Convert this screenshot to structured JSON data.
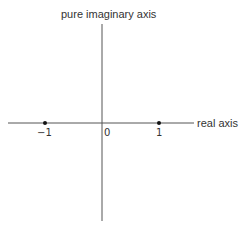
{
  "diagram": {
    "vertical_axis_label": "pure imaginary axis",
    "horizontal_axis_label": "real axis",
    "points": [
      {
        "label": "−1",
        "value": -1
      },
      {
        "label": "0",
        "value": 0
      },
      {
        "label": "1",
        "value": 1
      }
    ],
    "colors": {
      "axis": "#555555",
      "point": "#111111",
      "text": "#333333"
    }
  }
}
